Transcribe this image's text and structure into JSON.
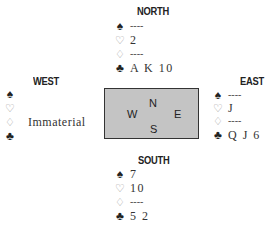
{
  "north": {
    "label": "NORTH",
    "spades": "----",
    "hearts": "2",
    "diamonds": "----",
    "clubs": "A K 10"
  },
  "west": {
    "label": "WEST",
    "spades": "",
    "hearts": "",
    "diamonds": "Immaterial",
    "clubs": ""
  },
  "east": {
    "label": "EAST",
    "spades": "----",
    "hearts": "J",
    "diamonds": "----",
    "clubs": "Q J 6"
  },
  "south": {
    "label": "SOUTH",
    "spades": "7",
    "hearts": "10",
    "diamonds": "----",
    "clubs": "5 2"
  },
  "compass": {
    "n": "N",
    "s": "S",
    "w": "W",
    "e": "E"
  },
  "suits": {
    "spades": "♠",
    "hearts": "♡",
    "diamonds": "♢",
    "clubs": "♣"
  },
  "colors": {
    "box_fill": "#c4c4c4",
    "red_suit": "#9a9a9a",
    "text": "#222222"
  }
}
